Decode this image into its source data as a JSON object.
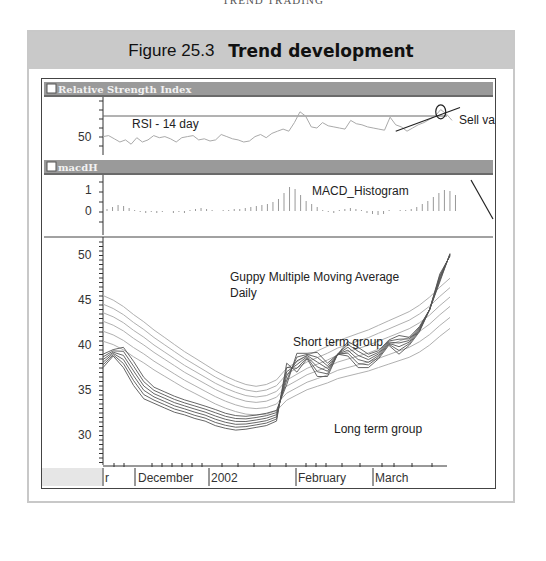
{
  "page": {
    "running_head": "TREND TRADING"
  },
  "figure": {
    "number": "Figure 25.3",
    "title": "Trend development"
  },
  "panels": {
    "rsi": {
      "title": "Relative Strength Index",
      "label": "RSI - 14 day",
      "annotation": "Sell value",
      "y_tick": "50"
    },
    "macd": {
      "title": "macdH",
      "label": "MACD_Histogram",
      "y_ticks": [
        "1",
        "0"
      ]
    },
    "price": {
      "label_line1": "Guppy Multiple Moving Average",
      "label_line2": "Daily",
      "short_group_label": "Short term group",
      "long_group_label": "Long term group",
      "y_ticks": [
        "50",
        "45",
        "40",
        "35",
        "30",
        "25"
      ]
    }
  },
  "x_axis": {
    "labels": [
      "r",
      "December",
      "2002",
      "February",
      "March"
    ]
  },
  "chart_data": [
    {
      "type": "line",
      "title": "Relative Strength Index",
      "annotation_text": [
        "RSI - 14 day",
        "Sell value"
      ],
      "ylabel": "",
      "y_ticks": [
        50
      ],
      "reference_line": 70,
      "x_labels": [
        "r",
        "December",
        "2002",
        "February",
        "March"
      ],
      "series": [
        {
          "name": "RSI - 14 day",
          "values": [
            47,
            48,
            45,
            42,
            44,
            40,
            46,
            42,
            44,
            48,
            46,
            47,
            45,
            42,
            46,
            47,
            48,
            44,
            45,
            43,
            44,
            49,
            47,
            45,
            44,
            42,
            43,
            47,
            49,
            46,
            50,
            52,
            54,
            52,
            60,
            70,
            66,
            56,
            55,
            60,
            57,
            56,
            55,
            54,
            62,
            59,
            58,
            56,
            55,
            54,
            53,
            65,
            58,
            56,
            52,
            55,
            58,
            60,
            63,
            66,
            72,
            68,
            62
          ]
        }
      ],
      "trendline": {
        "from_index": 52,
        "from_value": 52,
        "to_index": 62,
        "to_value": 74
      },
      "circled_point": {
        "index": 60,
        "value": 70
      }
    },
    {
      "type": "bar",
      "title": "macdH",
      "annotation_text": [
        "MACD_Histogram"
      ],
      "y_ticks": [
        1,
        0
      ],
      "x_labels": [
        "r",
        "December",
        "2002",
        "February",
        "March"
      ],
      "series": [
        {
          "name": "MACD_Histogram",
          "values": [
            0.1,
            0.2,
            0.3,
            0.25,
            0.15,
            0.05,
            -0.05,
            -0.1,
            -0.05,
            -0.1,
            -0.05,
            0.0,
            -0.1,
            -0.05,
            -0.1,
            0.05,
            0.1,
            0.15,
            0.1,
            0.05,
            0.0,
            0.05,
            0.05,
            0.1,
            0.1,
            0.15,
            0.2,
            0.25,
            0.3,
            0.35,
            0.45,
            0.6,
            0.9,
            1.2,
            1.1,
            0.8,
            0.5,
            0.35,
            0.2,
            0.05,
            -0.05,
            -0.1,
            0.05,
            0.1,
            0.15,
            0.1,
            0.05,
            -0.1,
            -0.15,
            -0.2,
            -0.15,
            0.05,
            0.0,
            0.05,
            0.05,
            0.1,
            0.2,
            0.35,
            0.5,
            0.7,
            0.9,
            1.05,
            1.0,
            0.8
          ]
        }
      ]
    },
    {
      "type": "line",
      "title": "Guppy Multiple Moving Average Daily",
      "annotation_text": [
        "Guppy Multiple Moving Average",
        "Daily",
        "Short term group",
        "Long term group"
      ],
      "ylim": [
        25,
        51
      ],
      "y_ticks": [
        50,
        45,
        40,
        35,
        30,
        25
      ],
      "x_labels": [
        "r",
        "December",
        "2002",
        "February",
        "March"
      ],
      "series": [
        {
          "name": "Short term group (avg)",
          "values": [
            34.5,
            35.8,
            34.5,
            32.5,
            31.0,
            30.5,
            30.0,
            29.5,
            29.2,
            28.8,
            28.5,
            28.0,
            27.7,
            27.5,
            27.6,
            27.8,
            28.0,
            28.5,
            35.0,
            34.0,
            35.5,
            33.5,
            33.5,
            36.0,
            35.8,
            34.5,
            34.5,
            35.5,
            37.0,
            36.0,
            37.0,
            38.5,
            41.0,
            45.0,
            47.0
          ]
        },
        {
          "name": "Long term group (avg)",
          "values": [
            38.0,
            37.6,
            37.0,
            36.2,
            35.5,
            34.7,
            34.0,
            33.3,
            32.6,
            32.0,
            31.4,
            30.8,
            30.3,
            29.9,
            29.6,
            29.5,
            29.6,
            30.0,
            31.2,
            31.8,
            32.4,
            32.8,
            33.2,
            33.7,
            34.0,
            34.3,
            34.6,
            35.0,
            35.4,
            35.8,
            36.2,
            36.8,
            37.6,
            38.6,
            39.5
          ]
        }
      ]
    }
  ]
}
